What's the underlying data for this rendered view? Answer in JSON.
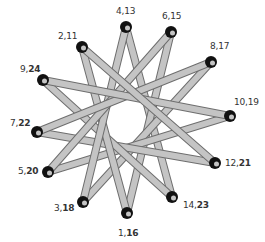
{
  "diagram": {
    "type": "star-polygon",
    "skip": 5,
    "colors": {
      "bar_fill": "#c4c4c4",
      "bar_outline": "#6e6e6e",
      "node": "#111111",
      "label": "#333333",
      "background": "#ffffff"
    },
    "nodes": [
      {
        "id": 0,
        "label_a": "4",
        "label_b": "13",
        "bold_b": false,
        "x": 126,
        "y": 27,
        "lx": 116,
        "ly": 6,
        "anchor": "center"
      },
      {
        "id": 1,
        "label_a": "6",
        "label_b": "15",
        "bold_b": false,
        "x": 171,
        "y": 32,
        "lx": 162,
        "ly": 11,
        "anchor": "center"
      },
      {
        "id": 2,
        "label_a": "8",
        "label_b": "17",
        "bold_b": false,
        "x": 211,
        "y": 62,
        "lx": 210,
        "ly": 41,
        "anchor": "left"
      },
      {
        "id": 3,
        "label_a": "10",
        "label_b": "19",
        "bold_b": false,
        "x": 230,
        "y": 116,
        "lx": 234,
        "ly": 97,
        "anchor": "left"
      },
      {
        "id": 4,
        "label_a": "12",
        "label_b": "21",
        "bold_b": true,
        "x": 215,
        "y": 163,
        "lx": 225,
        "ly": 158,
        "anchor": "left"
      },
      {
        "id": 5,
        "label_a": "14",
        "label_b": "23",
        "bold_b": true,
        "x": 172,
        "y": 197,
        "lx": 183,
        "ly": 200,
        "anchor": "left"
      },
      {
        "id": 6,
        "label_a": "1",
        "label_b": "16",
        "bold_b": true,
        "x": 127,
        "y": 213,
        "lx": 118,
        "ly": 228,
        "anchor": "center"
      },
      {
        "id": 7,
        "label_a": "3",
        "label_b": "18",
        "bold_b": true,
        "x": 83,
        "y": 202,
        "lx": 54,
        "ly": 203,
        "anchor": "right"
      },
      {
        "id": 8,
        "label_a": "5",
        "label_b": "20",
        "bold_b": true,
        "x": 48,
        "y": 172,
        "lx": 18,
        "ly": 166,
        "anchor": "right"
      },
      {
        "id": 9,
        "label_a": "7",
        "label_b": "22",
        "bold_b": true,
        "x": 37,
        "y": 132,
        "lx": 10,
        "ly": 118,
        "anchor": "right"
      },
      {
        "id": 10,
        "label_a": "9",
        "label_b": "24",
        "bold_b": true,
        "x": 43,
        "y": 80,
        "lx": 20,
        "ly": 64,
        "anchor": "right"
      },
      {
        "id": 11,
        "label_a": "2",
        "label_b": "11",
        "bold_b": false,
        "x": 82,
        "y": 47,
        "lx": 58,
        "ly": 31,
        "anchor": "right"
      }
    ]
  }
}
